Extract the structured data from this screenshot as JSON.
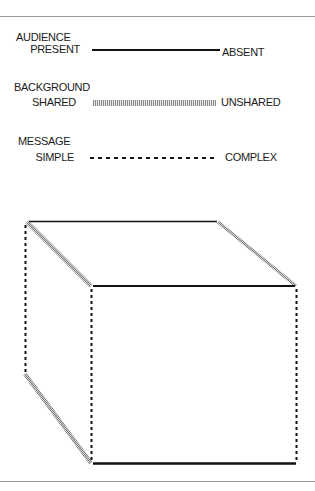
{
  "legend": {
    "items": [
      {
        "title": "AUDIENCE",
        "left_label": "PRESENT",
        "right_label": "ABSENT",
        "line_style": "solid"
      },
      {
        "title": "BACKGROUND",
        "left_label": "SHARED",
        "right_label": "UNSHARED",
        "line_style": "hatched"
      },
      {
        "title": "MESSAGE",
        "left_label": "SIMPLE",
        "right_label": "COMPLEX",
        "line_style": "dashed"
      }
    ]
  },
  "cube": {
    "description": "Cube whose edges encode the three dimensions: solid = audience, hatched = background, dashed = message",
    "colors": {
      "solid": "#111111",
      "hatched": "#9a9a9a",
      "dashed": "#111111"
    }
  }
}
